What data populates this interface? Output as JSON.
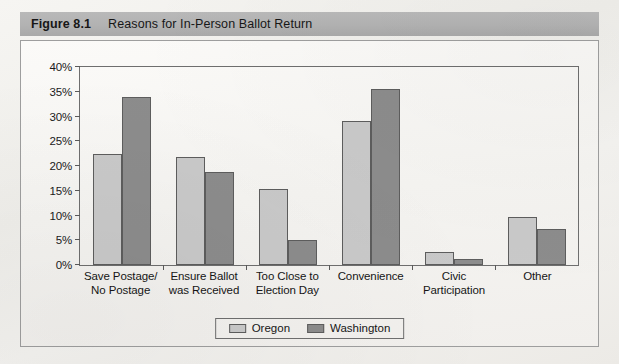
{
  "figure": {
    "number": "Figure 8.1",
    "title": "Reasons for In-Person Ballot Return"
  },
  "chart_data": {
    "type": "bar",
    "title": "Reasons for In-Person Ballot Return",
    "xlabel": "",
    "ylabel": "",
    "ylim": [
      0,
      40
    ],
    "ytick_labels": [
      "0%",
      "5%",
      "10%",
      "15%",
      "20%",
      "25%",
      "30%",
      "35%",
      "40%"
    ],
    "ytick_values": [
      0,
      5,
      10,
      15,
      20,
      25,
      30,
      35,
      40
    ],
    "grid": false,
    "legend_position": "bottom-center",
    "categories": [
      "Save Postage/\nNo Postage",
      "Ensure Ballot\nwas Received",
      "Too Close to\nElection Day",
      "Convenience",
      "Civic\nParticipation",
      "Other"
    ],
    "category_lines": [
      [
        "Save Postage/",
        "No Postage"
      ],
      [
        "Ensure Ballot",
        "was Received"
      ],
      [
        "Too Close to",
        "Election Day"
      ],
      [
        "Convenience",
        ""
      ],
      [
        "Civic",
        "Participation"
      ],
      [
        "Other",
        ""
      ]
    ],
    "series": [
      {
        "name": "Oregon",
        "color": "#c9c9c9",
        "values": [
          22.5,
          21.8,
          15.3,
          29.0,
          2.7,
          9.8
        ]
      },
      {
        "name": "Washington",
        "color": "#8c8c8c",
        "values": [
          34.0,
          18.7,
          5.0,
          35.5,
          1.3,
          7.2
        ]
      }
    ]
  },
  "legend": {
    "items": [
      {
        "label": "Oregon",
        "color": "#c9c9c9"
      },
      {
        "label": "Washington",
        "color": "#8c8c8c"
      }
    ]
  }
}
